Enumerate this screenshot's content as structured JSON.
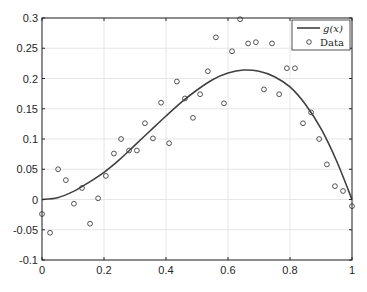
{
  "chart_data": {
    "type": "line",
    "title": "",
    "xlabel": "",
    "ylabel": "",
    "xlim": [
      0,
      1
    ],
    "ylim": [
      -0.1,
      0.3
    ],
    "grid": true,
    "legend_position": "northeast",
    "x_ticks": [
      0,
      0.2,
      0.4,
      0.6,
      0.8,
      1
    ],
    "x_tick_labels": [
      "0",
      "0.2",
      "0.4",
      "0.6",
      "0.8",
      "1"
    ],
    "y_ticks": [
      -0.1,
      -0.05,
      0,
      0.05,
      0.1,
      0.15,
      0.2,
      0.25,
      0.3
    ],
    "y_tick_labels": [
      "-0.1",
      "-0.05",
      "0",
      "0.05",
      "0.1",
      "0.15",
      "0.2",
      "0.25",
      "0.3"
    ],
    "series": [
      {
        "name": "g(x)",
        "legend_label": "g(x)",
        "type": "line",
        "color": "#404040",
        "x": [
          0,
          0.05,
          0.1,
          0.15,
          0.2,
          0.25,
          0.3,
          0.35,
          0.4,
          0.45,
          0.5,
          0.55,
          0.6,
          0.65,
          0.7,
          0.75,
          0.8,
          0.85,
          0.9,
          0.95,
          1.0
        ],
        "values": [
          0,
          0.003,
          0.013,
          0.028,
          0.045,
          0.066,
          0.09,
          0.114,
          0.138,
          0.161,
          0.181,
          0.198,
          0.209,
          0.214,
          0.212,
          0.203,
          0.186,
          0.157,
          0.117,
          0.064,
          0
        ]
      },
      {
        "name": "Data",
        "legend_label": "Data",
        "type": "scatter",
        "marker": "circle-open",
        "color": "#404040",
        "x": [
          0,
          0.026,
          0.052,
          0.077,
          0.103,
          0.129,
          0.155,
          0.181,
          0.206,
          0.232,
          0.255,
          0.281,
          0.306,
          0.332,
          0.358,
          0.384,
          0.41,
          0.435,
          0.461,
          0.487,
          0.51,
          0.535,
          0.561,
          0.587,
          0.613,
          0.639,
          0.665,
          0.69,
          0.716,
          0.742,
          0.765,
          0.79,
          0.816,
          0.842,
          0.868,
          0.894,
          0.919,
          0.945,
          0.971,
          1.0
        ],
        "values": [
          -0.024,
          -0.055,
          0.05,
          0.032,
          -0.007,
          0.019,
          -0.04,
          0.002,
          0.039,
          0.076,
          0.1,
          0.081,
          0.081,
          0.126,
          0.101,
          0.16,
          0.093,
          0.195,
          0.167,
          0.135,
          0.174,
          0.212,
          0.268,
          0.159,
          0.245,
          0.298,
          0.258,
          0.26,
          0.182,
          0.258,
          0.174,
          0.217,
          0.217,
          0.126,
          0.144,
          0.1,
          0.058,
          0.022,
          0.014,
          -0.011
        ]
      }
    ]
  },
  "legend": {
    "items": [
      {
        "label": "g(x)",
        "symbol": "line"
      },
      {
        "label": "Data",
        "symbol": "circle"
      }
    ]
  }
}
